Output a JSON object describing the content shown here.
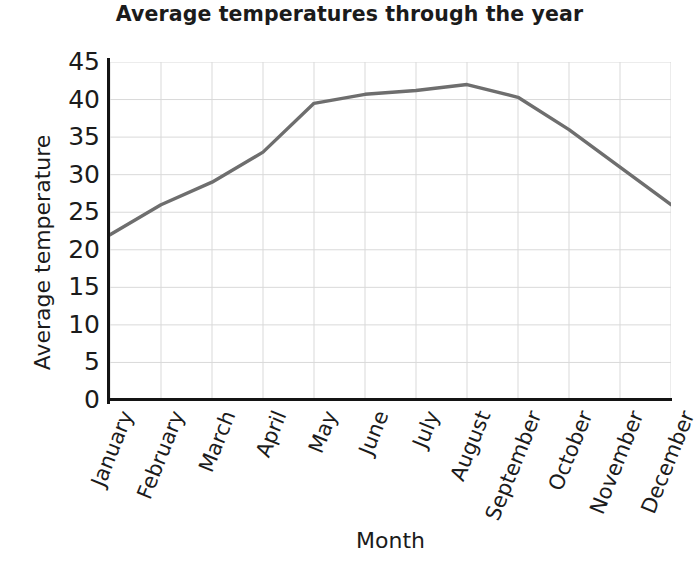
{
  "chart_data": {
    "type": "line",
    "title": "Average temperatures through the year",
    "xlabel": "Month",
    "ylabel": "Average temperature",
    "categories": [
      "January",
      "February",
      "March",
      "April",
      "May",
      "June",
      "July",
      "August",
      "September",
      "October",
      "November",
      "December"
    ],
    "series": [
      {
        "name": "Average temperature",
        "color": "#6e6e6e",
        "values": [
          22,
          26,
          29,
          33,
          39.5,
          40.7,
          41.2,
          42,
          40.3,
          36,
          31,
          26
        ]
      }
    ],
    "ylim": [
      0,
      45
    ],
    "y_ticks": [
      0,
      5,
      10,
      15,
      20,
      25,
      30,
      35,
      40,
      45
    ],
    "y_tick_labels": [
      "0",
      "5",
      "10",
      "15",
      "20",
      "25",
      "30",
      "35",
      "40",
      "45"
    ],
    "grid": true,
    "grid_color": "#d9d9d9",
    "legend": "none",
    "axis_color": "#141414"
  }
}
